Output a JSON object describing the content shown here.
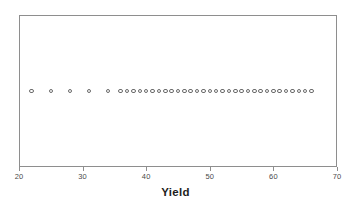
{
  "figure": {
    "name": "yield-dotplot",
    "background_color": "#ffffff",
    "frame_color": "#8e8e8e",
    "dot_color": "#6b6b6b"
  },
  "chart_data": {
    "type": "scatter",
    "plot_style": "dotplot",
    "title": "",
    "subtitle": "",
    "xlabel": "Yield",
    "ylabel": "",
    "xlim": [
      20,
      70
    ],
    "ylim": [
      0,
      1
    ],
    "grid": false,
    "legend": false,
    "legend_position": "none",
    "x_ticks": [
      20,
      30,
      40,
      50,
      60,
      70
    ],
    "x_tick_labels": [
      "20",
      "30",
      "40",
      "50",
      "60",
      "70"
    ],
    "y_ticks": [],
    "y_tick_labels": [],
    "marker": "open-circle",
    "series": [
      {
        "name": "Yield",
        "x": [
          22,
          25,
          28,
          31,
          34,
          36,
          37,
          38,
          39,
          40,
          41,
          42,
          43,
          44,
          45,
          46,
          47,
          48,
          49,
          50,
          51,
          52,
          53,
          54,
          55,
          56,
          57,
          58,
          59,
          60,
          61,
          62,
          63,
          64,
          65,
          66
        ],
        "y": [
          0.5,
          0.5,
          0.5,
          0.5,
          0.5,
          0.5,
          0.5,
          0.5,
          0.5,
          0.5,
          0.5,
          0.5,
          0.5,
          0.5,
          0.5,
          0.5,
          0.5,
          0.5,
          0.5,
          0.5,
          0.5,
          0.5,
          0.5,
          0.5,
          0.5,
          0.5,
          0.5,
          0.5,
          0.5,
          0.5,
          0.5,
          0.5,
          0.5,
          0.5,
          0.5,
          0.5
        ],
        "count": 36
      }
    ],
    "annotations": []
  }
}
